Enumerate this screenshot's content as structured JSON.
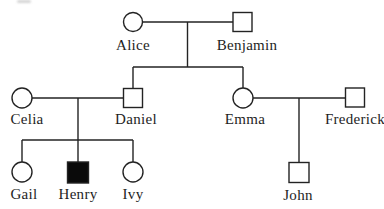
{
  "figure": {
    "type": "pedigree-chart",
    "background": "#ffffff",
    "stroke_color": "#232323",
    "stroke_width": 1.4,
    "text_color": "#1e1e1e",
    "unaffected_fill": "#ffffff",
    "affected_fill": "#0a0a0a"
  },
  "pedigree": {
    "members": [
      {
        "id": "alice",
        "label": "Alice",
        "shape": "circle",
        "affected": false,
        "cx": 133,
        "cy": 22,
        "r": 9.5,
        "size": 19,
        "label_x": 133,
        "label_y": 50
      },
      {
        "id": "benjamin",
        "label": "Benjamin",
        "shape": "square",
        "affected": false,
        "cx": 242.5,
        "cy": 22,
        "r": 9.5,
        "size": 19,
        "label_x": 247,
        "label_y": 50
      },
      {
        "id": "celia",
        "label": "Celia",
        "shape": "circle",
        "affected": false,
        "cx": 22,
        "cy": 98,
        "r": 10,
        "size": 20,
        "label_x": 27,
        "label_y": 124
      },
      {
        "id": "daniel",
        "label": "Daniel",
        "shape": "square",
        "affected": false,
        "cx": 133,
        "cy": 98,
        "r": 10,
        "size": 19,
        "label_x": 136,
        "label_y": 124
      },
      {
        "id": "emma",
        "label": "Emma",
        "shape": "circle",
        "affected": false,
        "cx": 243,
        "cy": 98,
        "r": 10,
        "size": 20,
        "label_x": 245,
        "label_y": 124
      },
      {
        "id": "frederick",
        "label": "Frederick",
        "shape": "square",
        "affected": false,
        "cx": 355,
        "cy": 97.5,
        "r": 9.5,
        "size": 19,
        "label_x": 355,
        "label_y": 124
      },
      {
        "id": "gail",
        "label": "Gail",
        "shape": "circle",
        "affected": false,
        "cx": 22,
        "cy": 172,
        "r": 10,
        "size": 20,
        "label_x": 24,
        "label_y": 199
      },
      {
        "id": "henry",
        "label": "Henry",
        "shape": "square",
        "affected": true,
        "cx": 78,
        "cy": 172.5,
        "r": 10,
        "size": 21,
        "label_x": 78,
        "label_y": 199
      },
      {
        "id": "ivy",
        "label": "Ivy",
        "shape": "circle",
        "affected": false,
        "cx": 133,
        "cy": 172,
        "r": 10,
        "size": 20,
        "label_x": 133,
        "label_y": 199
      },
      {
        "id": "john",
        "label": "John",
        "shape": "square",
        "affected": false,
        "cx": 299,
        "cy": 172.5,
        "r": 10,
        "size": 20,
        "label_x": 298,
        "label_y": 200
      }
    ],
    "couples": [
      [
        "alice",
        "benjamin"
      ],
      [
        "celia",
        "daniel"
      ],
      [
        "emma",
        "frederick"
      ]
    ],
    "offspring": [
      {
        "parents": [
          "alice",
          "benjamin"
        ],
        "children": [
          "daniel",
          "emma"
        ]
      },
      {
        "parents": [
          "celia",
          "daniel"
        ],
        "children": [
          "gail",
          "henry",
          "ivy"
        ]
      },
      {
        "parents": [
          "emma",
          "frederick"
        ],
        "children": [
          "john"
        ]
      }
    ],
    "lines": [
      {
        "name": "couple-line-alice-benjamin",
        "x1": 142.5,
        "y1": 22,
        "x2": 233,
        "y2": 22
      },
      {
        "name": "descent-line-alice-benjamin",
        "x1": 187.5,
        "y1": 22,
        "x2": 187.5,
        "y2": 67
      },
      {
        "name": "sibling-bar-gen2",
        "x1": 133,
        "y1": 67,
        "x2": 243,
        "y2": 67
      },
      {
        "name": "drop-to-daniel",
        "x1": 133,
        "y1": 67,
        "x2": 133,
        "y2": 88.5
      },
      {
        "name": "drop-to-emma",
        "x1": 243,
        "y1": 67,
        "x2": 243,
        "y2": 88
      },
      {
        "name": "couple-line-celia-daniel",
        "x1": 32,
        "y1": 98,
        "x2": 123.5,
        "y2": 98
      },
      {
        "name": "descent-line-celia-daniel",
        "x1": 78,
        "y1": 98,
        "x2": 78,
        "y2": 140
      },
      {
        "name": "sibling-bar-gen3",
        "x1": 22,
        "y1": 140,
        "x2": 133,
        "y2": 140
      },
      {
        "name": "drop-to-gail",
        "x1": 22,
        "y1": 140,
        "x2": 22,
        "y2": 162
      },
      {
        "name": "drop-to-henry",
        "x1": 78,
        "y1": 140,
        "x2": 78,
        "y2": 162
      },
      {
        "name": "drop-to-ivy",
        "x1": 133,
        "y1": 140,
        "x2": 133,
        "y2": 162
      },
      {
        "name": "couple-line-emma-frederick",
        "x1": 253,
        "y1": 98,
        "x2": 345.5,
        "y2": 98
      },
      {
        "name": "descent-line-to-john",
        "x1": 299,
        "y1": 98,
        "x2": 299,
        "y2": 162.5
      }
    ]
  }
}
